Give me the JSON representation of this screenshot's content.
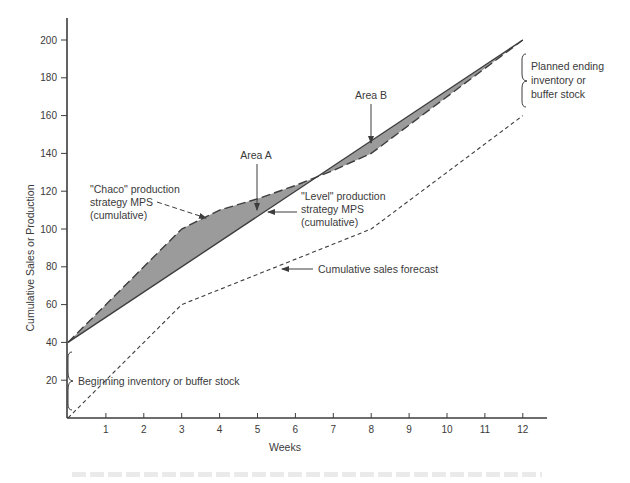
{
  "chart_data": {
    "type": "line",
    "title": "",
    "xlabel": "Weeks",
    "ylabel": "Cumulative Sales or Production",
    "xlim": [
      0,
      12.6
    ],
    "ylim": [
      0,
      210
    ],
    "x_ticks": [
      1,
      2,
      3,
      4,
      5,
      6,
      7,
      8,
      9,
      10,
      11,
      12
    ],
    "y_ticks": [
      20,
      40,
      60,
      80,
      100,
      120,
      140,
      160,
      180,
      200
    ],
    "grid": false,
    "legend": "none (inline annotations)",
    "series": [
      {
        "name": "\"Level\" production strategy MPS (cumulative)",
        "style": "solid",
        "x": [
          0,
          12
        ],
        "values": [
          40,
          200
        ]
      },
      {
        "name": "\"Chase\" production strategy MPS (cumulative)",
        "style": "long-dash",
        "x": [
          0,
          3,
          4,
          5,
          6,
          7,
          8,
          12
        ],
        "values": [
          40,
          100,
          110,
          116,
          123,
          131,
          140,
          200
        ]
      },
      {
        "name": "Cumulative sales forecast",
        "style": "short-dash",
        "x": [
          0,
          3,
          8,
          12
        ],
        "values": [
          0,
          60,
          100,
          160
        ]
      }
    ],
    "shaded_areas": [
      {
        "name": "Area A",
        "between": [
          "Chase",
          "Level"
        ],
        "x_range": [
          0,
          7
        ]
      },
      {
        "name": "Area B",
        "between": [
          "Level",
          "Chase"
        ],
        "x_range": [
          7,
          12
        ]
      }
    ],
    "annotations": [
      {
        "text": "Area A",
        "points_to": [
          5,
          112
        ]
      },
      {
        "text": "Area B",
        "points_to": [
          8,
          143
        ]
      },
      {
        "text": "\"Chaco\" production\nstrategy MPS\n(cumulative)",
        "points_to": [
          4.1,
          109
        ]
      },
      {
        "text": "\"Level\" production\nstrategy MPS\n(cumulative)",
        "points_to": [
          5.3,
          111
        ]
      },
      {
        "text": "Cumulative sales forecast",
        "points_to": [
          5.6,
          81
        ]
      },
      {
        "text": "Beginning inventory or buffer stock",
        "brace_range": [
          0,
          40
        ]
      },
      {
        "text": "Planned ending\ninventory or\nbuffer stock",
        "brace_range": [
          160,
          200
        ]
      }
    ]
  },
  "labels": {
    "xlabel": "Weeks",
    "ylabel": "Cumulative Sales or Production",
    "area_a": "Area A",
    "area_b": "Area B",
    "chase": [
      "\"Chaco\" production",
      "strategy  MPS",
      "(cumulative)"
    ],
    "level": [
      "\"Level\" production",
      "strategy  MPS",
      "(cumulative)"
    ],
    "sales": "Cumulative sales forecast",
    "beginning": "Beginning inventory or buffer stock",
    "ending": [
      "Planned ending",
      "inventory or",
      "buffer stock"
    ]
  },
  "colors": {
    "axis": "#3d3d3d",
    "line": "#3d3d3d",
    "fill": "#9b9b9b",
    "text": "#3a3a3a"
  }
}
